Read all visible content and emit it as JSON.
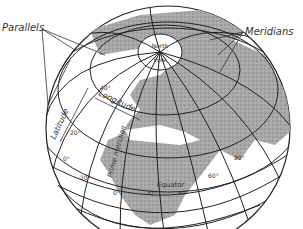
{
  "diagram": {
    "type": "globe-coordinate-grid",
    "labels": {
      "parallels": "Parallels",
      "meridians": "Meridians",
      "north_pole_line1": "North",
      "north_pole_line2": "+",
      "north_pole_line3": "Pole",
      "latitude": "Latitude",
      "longitude": "Longitude",
      "prime_meridian": "Prime meridian",
      "equator": "Equator"
    },
    "degree_labels": {
      "lat_40": "40°",
      "lat_20": "20°",
      "lat_0": "0°",
      "lon_20w": "20°",
      "lon_0": "0°",
      "lon_20e": "20°",
      "lon_40": "40°",
      "lon_60": "60°",
      "lon_80": "80°",
      "lat_left_0": "0°"
    },
    "colors": {
      "line": "#222222",
      "land": "#9a9a9a",
      "ocean": "#ffffff",
      "text": "#333333"
    }
  }
}
